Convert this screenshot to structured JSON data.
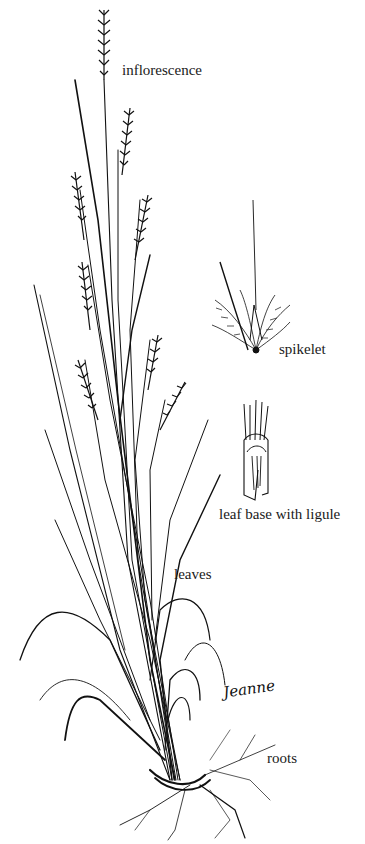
{
  "figure": {
    "ink_color": "#111111",
    "background_color": "#ffffff"
  },
  "labels": {
    "inflorescence": "inflorescence",
    "spikelet": "spikelet",
    "leaf_base": "leaf base with ligule",
    "leaves": "leaves",
    "roots": "roots"
  },
  "signature": "Jeanne"
}
